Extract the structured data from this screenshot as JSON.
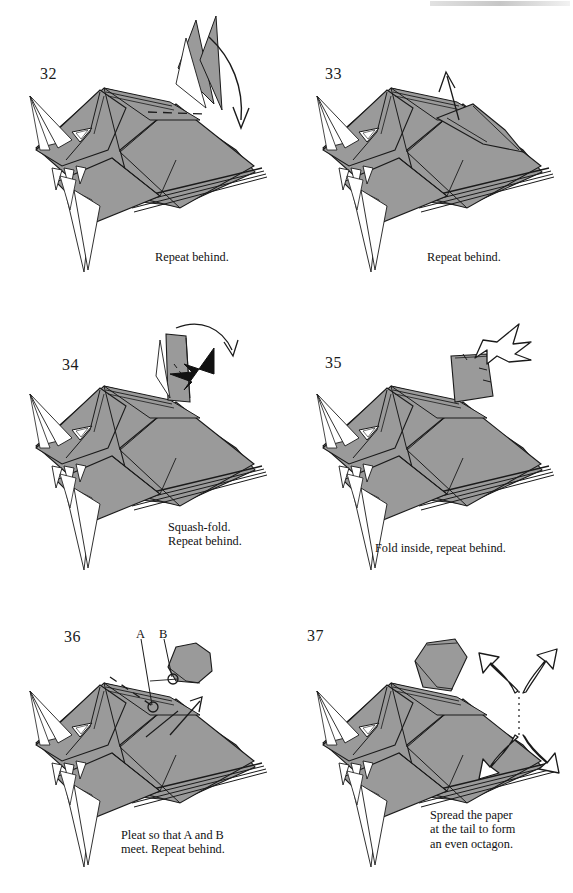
{
  "document": {
    "type": "origami-folding-instructions",
    "page_background": "#ffffff",
    "paper_fill": "#9a9a9a",
    "paper_fill_shadow": "#8a8a8a",
    "line_color": "#1a1a1a",
    "panel_count": 6,
    "grid": "2 columns x 3 rows"
  },
  "panels": [
    {
      "step": "32",
      "caption": "Repeat behind.",
      "arrows": [
        {
          "kind": "valley-fold-curved-arrow",
          "direction": "down-right",
          "description": "curved thin arrow from upper spike sweeping down to the right"
        }
      ],
      "creases": [
        {
          "kind": "dashed-fold-line",
          "description": "horizontal dashed valley crease across the upper back"
        }
      ],
      "model_parts": [
        "head-spikes",
        "eye",
        "body",
        "legs",
        "layered-tail",
        "dorsal-fin"
      ]
    },
    {
      "step": "33",
      "caption": "Repeat behind.",
      "arrows": [
        {
          "kind": "straight-fold-arrow",
          "direction": "up",
          "description": "thin straight arrow pointing up out of the raised flap"
        }
      ],
      "creases": [],
      "model_parts": [
        "head-spikes",
        "eye",
        "body",
        "legs",
        "layered-tail",
        "raised-flap"
      ]
    },
    {
      "step": "34",
      "caption": "Squash-fold.\nRepeat behind.",
      "arrows": [
        {
          "kind": "squash-fold-solid-arrow",
          "direction": "left",
          "description": "solid black tapered push arrow pointing left into the raised flap"
        },
        {
          "kind": "curved-thin-arrow",
          "direction": "right-down",
          "description": "thin curved arrow arcing over the top to the right"
        }
      ],
      "creases": [
        {
          "kind": "dashed-fold-line",
          "description": "short dashed crease on the raised flap"
        }
      ],
      "model_parts": [
        "head-spikes",
        "eye",
        "body",
        "legs",
        "layered-tail",
        "raised-flap"
      ]
    },
    {
      "step": "35",
      "caption": "Fold inside, repeat behind.",
      "arrows": [
        {
          "kind": "push-in-hollow-arrow",
          "direction": "down-left",
          "description": "hollow outline arrow with forked tail pushing into the flap"
        }
      ],
      "creases": [
        {
          "kind": "dashed-fold-line",
          "description": "two short dashes marking the inside fold on the squashed flap"
        }
      ],
      "model_parts": [
        "head-spikes",
        "eye",
        "body",
        "legs",
        "layered-tail",
        "squashed-flap"
      ]
    },
    {
      "step": "36",
      "caption": "Pleat so that A and B\nmeet. Repeat behind.",
      "point_labels": [
        {
          "label": "A",
          "marker": "small-circle",
          "description": "reference point on the body, lower-left of B"
        },
        {
          "label": "B",
          "marker": "small-circle",
          "description": "reference point at the base of the neck flap"
        }
      ],
      "arrows": [
        {
          "kind": "pleat-arrow",
          "direction": "up-right",
          "description": "straight pleat arrow pointing up-right"
        },
        {
          "kind": "pleat-arrow-secondary",
          "direction": "up-right",
          "description": "second thin pleat indicator line"
        }
      ],
      "creases": [
        {
          "kind": "dashed-fold-line",
          "description": "long dashed pleat line running down-left from the neck"
        }
      ],
      "model_parts": [
        "head-spikes",
        "eye",
        "body",
        "legs",
        "layered-tail",
        "neck-flap"
      ]
    },
    {
      "step": "37",
      "caption": "Spread the paper\nat the tail to form\nan even octagon.",
      "arrows": [
        {
          "kind": "spread-hollow-arrow",
          "direction": "up-left",
          "description": "hollow outline arrow spreading up-left from tail tip"
        },
        {
          "kind": "spread-hollow-arrow",
          "direction": "up-right",
          "description": "hollow outline arrow spreading up-right from tail tip"
        },
        {
          "kind": "spread-hollow-arrow",
          "direction": "down-left",
          "description": "hollow outline arrow spreading down-left from tail tip"
        },
        {
          "kind": "spread-hollow-arrow",
          "direction": "down-right",
          "description": "hollow outline arrow spreading down-right from tail tip"
        }
      ],
      "creases": [
        {
          "kind": "dotted-line",
          "description": "vertical dotted spread line at the tail"
        }
      ],
      "model_parts": [
        "head-spikes",
        "eye",
        "body",
        "legs",
        "layered-tail",
        "neck-flap"
      ]
    }
  ]
}
